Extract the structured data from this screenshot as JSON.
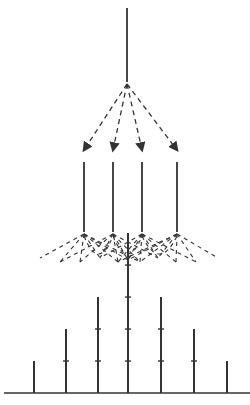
{
  "diagram": {
    "stroke_color": "#333333",
    "background": "#ffffff",
    "source": {
      "x": 127,
      "y1": 8,
      "y2": 82
    },
    "branches": [
      {
        "x": 84,
        "y1": 162,
        "y2": 232
      },
      {
        "x": 113,
        "y1": 162,
        "y2": 232
      },
      {
        "x": 142,
        "y1": 162,
        "y2": 232
      },
      {
        "x": 177,
        "y1": 162,
        "y2": 232
      }
    ],
    "distribution": {
      "baseline_y": 393,
      "bars": [
        {
          "x": 34,
          "units": 1
        },
        {
          "x": 66,
          "units": 2
        },
        {
          "x": 98,
          "units": 3
        },
        {
          "x": 128,
          "units": 5
        },
        {
          "x": 161,
          "units": 3
        },
        {
          "x": 194,
          "units": 2
        },
        {
          "x": 227,
          "units": 1
        }
      ]
    }
  }
}
